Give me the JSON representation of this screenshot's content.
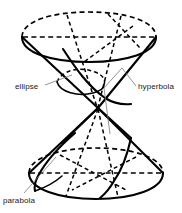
{
  "figure": {
    "background_color": "#ffffff",
    "line_color": "#000000",
    "leader_color": "#7a7a7a",
    "text_color": "#1a1a1a"
  },
  "labels": {
    "ellipse": "ellipse",
    "hyperbola": "hyperbola",
    "parabola": "parabola"
  },
  "geometry": {
    "upper_nappe": "inverted cone with top circular rim",
    "lower_nappe": "upright cone with bottom circular rim",
    "apex": "shared vertex at center of figure"
  }
}
